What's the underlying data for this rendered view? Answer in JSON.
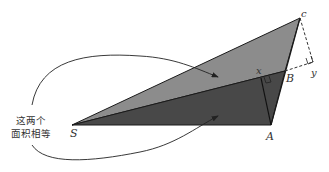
{
  "diagram": {
    "points": {
      "S": "S",
      "A": "A",
      "B": "B",
      "C": "c",
      "x": "x",
      "y": "y"
    },
    "annotation": {
      "line1": "这两个",
      "line2": "面积相等"
    },
    "colors": {
      "upper_triangle": "#8a8a8a",
      "lower_triangle": "#4a4a4a",
      "stroke": "#1a1a1a",
      "text": "#333333"
    }
  }
}
